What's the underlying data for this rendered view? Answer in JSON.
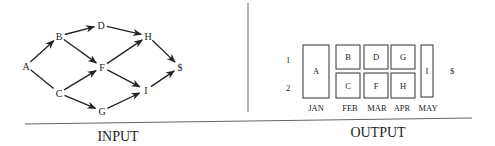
{
  "input": {
    "title": "INPUT",
    "nodes": [
      {
        "id": "A",
        "label": "A",
        "x": 26,
        "y": 66
      },
      {
        "id": "B",
        "label": "B",
        "x": 59,
        "y": 36
      },
      {
        "id": "C",
        "label": "C",
        "x": 59,
        "y": 93
      },
      {
        "id": "D",
        "label": "D",
        "x": 101,
        "y": 25
      },
      {
        "id": "F",
        "label": "F",
        "x": 102,
        "y": 67
      },
      {
        "id": "G",
        "label": "G",
        "x": 102,
        "y": 111
      },
      {
        "id": "H",
        "label": "H",
        "x": 148,
        "y": 36
      },
      {
        "id": "I",
        "label": "I",
        "x": 146,
        "y": 90
      },
      {
        "id": "$",
        "label": "$",
        "x": 180,
        "y": 67
      }
    ],
    "edges": [
      {
        "from": "A",
        "to": "B",
        "arrow": true
      },
      {
        "from": "A",
        "to": "C",
        "arrow": false
      },
      {
        "from": "B",
        "to": "D",
        "arrow": true
      },
      {
        "from": "B",
        "to": "F",
        "arrow": true
      },
      {
        "from": "C",
        "to": "F",
        "arrow": true
      },
      {
        "from": "C",
        "to": "G",
        "arrow": true
      },
      {
        "from": "D",
        "to": "H",
        "arrow": true
      },
      {
        "from": "F",
        "to": "H",
        "arrow": true
      },
      {
        "from": "F",
        "to": "I",
        "arrow": true
      },
      {
        "from": "G",
        "to": "I",
        "arrow": true
      },
      {
        "from": "H",
        "to": "$",
        "arrow": true
      },
      {
        "from": "I",
        "to": "$",
        "arrow": true
      }
    ]
  },
  "output": {
    "title": "OUTPUT",
    "row_labels": [
      "1",
      "2"
    ],
    "months": [
      "JAN",
      "FEB",
      "MAR",
      "APR",
      "MAY"
    ],
    "boxes": [
      {
        "label": "A",
        "month": "JAN",
        "rows": "1-2"
      },
      {
        "label": "B",
        "month": "FEB",
        "rows": "1"
      },
      {
        "label": "C",
        "month": "FEB",
        "rows": "2"
      },
      {
        "label": "D",
        "month": "MAR",
        "rows": "1"
      },
      {
        "label": "F",
        "month": "MAR",
        "rows": "2"
      },
      {
        "label": "G",
        "month": "APR",
        "rows": "1"
      },
      {
        "label": "H",
        "month": "APR",
        "rows": "2"
      },
      {
        "label": "I",
        "month": "MAY",
        "rows": "1-2"
      }
    ],
    "terminal": "$"
  }
}
